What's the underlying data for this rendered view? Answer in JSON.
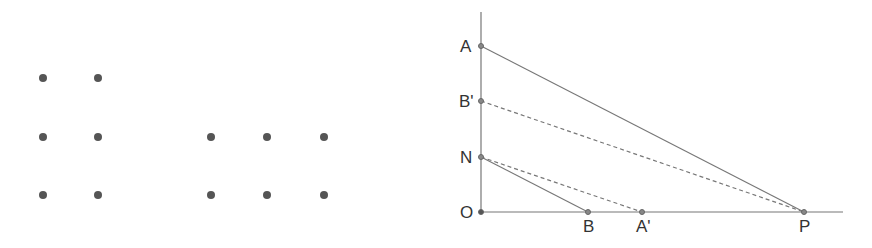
{
  "dots": {
    "group_left": [
      {
        "x": 43,
        "y": 78
      },
      {
        "x": 98,
        "y": 78
      },
      {
        "x": 43,
        "y": 137
      },
      {
        "x": 98,
        "y": 137
      },
      {
        "x": 43,
        "y": 195
      },
      {
        "x": 98,
        "y": 195
      }
    ],
    "group_right": [
      {
        "x": 211,
        "y": 137
      },
      {
        "x": 267,
        "y": 137
      },
      {
        "x": 324,
        "y": 137
      },
      {
        "x": 211,
        "y": 195
      },
      {
        "x": 267,
        "y": 195
      },
      {
        "x": 324,
        "y": 195
      }
    ],
    "color": "#555555"
  },
  "diagram": {
    "points": {
      "A": {
        "label": "A",
        "x": 481,
        "y": 46
      },
      "B_prime": {
        "label": "B'",
        "x": 481,
        "y": 101
      },
      "N": {
        "label": "N",
        "x": 481,
        "y": 157
      },
      "O": {
        "label": "O",
        "x": 481,
        "y": 212
      },
      "B": {
        "label": "B",
        "x": 588,
        "y": 212
      },
      "A_prime": {
        "label": "A'",
        "x": 642,
        "y": 212
      },
      "P": {
        "label": "P",
        "x": 804,
        "y": 212
      }
    },
    "line_color": "#777777"
  }
}
